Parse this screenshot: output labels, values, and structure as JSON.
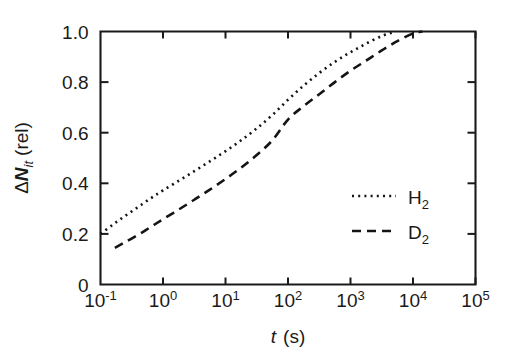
{
  "chart_data": {
    "type": "line",
    "title": "",
    "xlabel": "t (s)",
    "xlabel_parts": {
      "symbol": "t",
      "unit": "(s)"
    },
    "ylabel": "ΔNit (rel)",
    "ylabel_parts": {
      "delta": "Δ",
      "symbol": "N",
      "subscript": "it",
      "unit": "(rel)"
    },
    "xscale": "log",
    "yscale": "linear",
    "xlim": [
      -1,
      5
    ],
    "ylim": [
      0,
      1
    ],
    "grid": false,
    "legend_position": "center-right",
    "x_tick_labels": [
      "10⁻¹",
      "10⁰",
      "10¹",
      "10²",
      "10³",
      "10⁴",
      "10⁵"
    ],
    "x_tick_exponents": [
      "-1",
      "0",
      "1",
      "2",
      "3",
      "4",
      "5"
    ],
    "x_tick_mantissa": "10",
    "y_tick_labels": [
      "0",
      "0.2",
      "0.4",
      "0.6",
      "0.8",
      "1.0"
    ],
    "y_tick_values": [
      0,
      0.2,
      0.4,
      0.6,
      0.8,
      1.0
    ],
    "series": [
      {
        "name": "H2",
        "label_base": "H",
        "label_sub": "2",
        "style": "dotted",
        "dasharray": "2,4.2",
        "x_log10": [
          -1.0,
          -0.8,
          -0.6,
          -0.4,
          -0.2,
          0.0,
          0.25,
          0.5,
          0.75,
          1.0,
          1.25,
          1.5,
          1.75,
          2.0,
          2.25,
          2.5,
          2.75,
          3.0,
          3.25,
          3.5,
          3.7
        ],
        "values": [
          0.2,
          0.237,
          0.272,
          0.306,
          0.34,
          0.372,
          0.41,
          0.448,
          0.487,
          0.527,
          0.57,
          0.617,
          0.67,
          0.73,
          0.786,
          0.836,
          0.88,
          0.918,
          0.952,
          0.982,
          0.998
        ]
      },
      {
        "name": "D2",
        "label_base": "D",
        "label_sub": "2",
        "style": "dashed",
        "dasharray": "9,6",
        "x_log10": [
          -0.77,
          -0.6,
          -0.4,
          -0.2,
          0.0,
          0.25,
          0.5,
          0.75,
          1.0,
          1.25,
          1.5,
          1.75,
          2.0,
          2.25,
          2.5,
          2.75,
          3.0,
          3.25,
          3.5,
          3.75,
          4.0,
          4.15
        ],
        "values": [
          0.145,
          0.168,
          0.196,
          0.227,
          0.258,
          0.296,
          0.335,
          0.375,
          0.417,
          0.462,
          0.512,
          0.57,
          0.652,
          0.705,
          0.752,
          0.8,
          0.845,
          0.885,
          0.925,
          0.962,
          0.992,
          1.0
        ]
      }
    ]
  }
}
